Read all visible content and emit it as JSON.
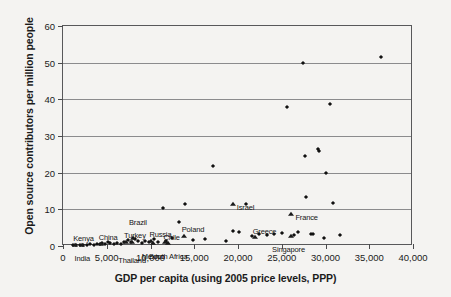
{
  "chart_data": {
    "type": "scatter",
    "title": "",
    "xlabel": "GDP per capita (using 2005 price levels, PPP)",
    "ylabel": "Open source contributors per million people",
    "xlim": [
      0,
      40000
    ],
    "ylim": [
      0,
      60
    ],
    "grid": true,
    "legend": "none",
    "xticks": [
      0,
      5000,
      10000,
      15000,
      20000,
      25000,
      30000,
      35000,
      40000
    ],
    "xtick_labels": [
      "0",
      "5,000",
      "10,000",
      "15,000",
      "20,000",
      "25,000",
      "30,000",
      "35,000",
      "40,000"
    ],
    "yticks": [
      0,
      10,
      20,
      30,
      40,
      50,
      60
    ],
    "ytick_labels": [
      "0",
      "10",
      "20",
      "30",
      "40",
      "50",
      "60"
    ],
    "series": [
      {
        "name": "unlabeled countries",
        "marker": "diamond",
        "points": [
          {
            "x": 1100,
            "y": 0.2
          },
          {
            "x": 1500,
            "y": 0.3
          },
          {
            "x": 1900,
            "y": 0.2
          },
          {
            "x": 2300,
            "y": 0.4
          },
          {
            "x": 2700,
            "y": 0.3
          },
          {
            "x": 3100,
            "y": 0.5
          },
          {
            "x": 3500,
            "y": 0.4
          },
          {
            "x": 3900,
            "y": 0.6
          },
          {
            "x": 4200,
            "y": 0.5
          },
          {
            "x": 4500,
            "y": 0.8
          },
          {
            "x": 4800,
            "y": 0.6
          },
          {
            "x": 5100,
            "y": 1.0
          },
          {
            "x": 5400,
            "y": 0.7
          },
          {
            "x": 5800,
            "y": 0.5
          },
          {
            "x": 6200,
            "y": 0.9
          },
          {
            "x": 6600,
            "y": 0.6
          },
          {
            "x": 7000,
            "y": 1.2
          },
          {
            "x": 7400,
            "y": 1.6
          },
          {
            "x": 7800,
            "y": 1.1
          },
          {
            "x": 8200,
            "y": 2.0
          },
          {
            "x": 8600,
            "y": 1.3
          },
          {
            "x": 9000,
            "y": 0.9
          },
          {
            "x": 9400,
            "y": 1.5
          },
          {
            "x": 9800,
            "y": 1.2
          },
          {
            "x": 10400,
            "y": 1.8
          },
          {
            "x": 10900,
            "y": 1.1
          },
          {
            "x": 11400,
            "y": 10.3
          },
          {
            "x": 11800,
            "y": 1.4
          },
          {
            "x": 12400,
            "y": 2.2
          },
          {
            "x": 13200,
            "y": 6.6
          },
          {
            "x": 13900,
            "y": 11.5
          },
          {
            "x": 14800,
            "y": 1.6
          },
          {
            "x": 16200,
            "y": 2.0
          },
          {
            "x": 17100,
            "y": 21.9
          },
          {
            "x": 18600,
            "y": 1.3
          },
          {
            "x": 19400,
            "y": 4.2
          },
          {
            "x": 20100,
            "y": 3.9
          },
          {
            "x": 20900,
            "y": 11.4
          },
          {
            "x": 21600,
            "y": 2.6
          },
          {
            "x": 22400,
            "y": 3.4
          },
          {
            "x": 23300,
            "y": 2.9
          },
          {
            "x": 24100,
            "y": 3.3
          },
          {
            "x": 25000,
            "y": 3.6
          },
          {
            "x": 25600,
            "y": 37.8
          },
          {
            "x": 26400,
            "y": 3.1
          },
          {
            "x": 26900,
            "y": 3.9
          },
          {
            "x": 27400,
            "y": 50.0
          },
          {
            "x": 27600,
            "y": 24.6
          },
          {
            "x": 27800,
            "y": 13.4
          },
          {
            "x": 28300,
            "y": 3.4
          },
          {
            "x": 28600,
            "y": 3.3
          },
          {
            "x": 29100,
            "y": 26.4
          },
          {
            "x": 29300,
            "y": 25.8
          },
          {
            "x": 29800,
            "y": 2.3
          },
          {
            "x": 30100,
            "y": 19.8
          },
          {
            "x": 30500,
            "y": 38.8
          },
          {
            "x": 30900,
            "y": 11.7
          },
          {
            "x": 31600,
            "y": 3.0
          },
          {
            "x": 36300,
            "y": 51.6
          }
        ]
      },
      {
        "name": "labeled countries",
        "marker": "triangle",
        "points": [
          {
            "x": 1400,
            "y": 0.2,
            "label": "Kenya",
            "lx": -2,
            "ly": -11,
            "anchor": "start"
          },
          {
            "x": 2200,
            "y": 0.3,
            "label": "India",
            "lx": 0,
            "ly": 9,
            "anchor": "middle"
          },
          {
            "x": 4300,
            "y": 0.6,
            "label": "China",
            "lx": -2,
            "ly": -11,
            "anchor": "start"
          },
          {
            "x": 7200,
            "y": 1.2,
            "label": "Turkey",
            "lx": -2,
            "ly": -11,
            "anchor": "start"
          },
          {
            "x": 7900,
            "y": 1.0,
            "label": "Thailand",
            "lx": 0,
            "ly": 14,
            "anchor": "middle"
          },
          {
            "x": 8000,
            "y": 2.3,
            "label": "Brazil",
            "lx": -4,
            "ly": -20,
            "anchor": "start"
          },
          {
            "x": 10100,
            "y": 1.5,
            "label": "Russia",
            "lx": -2,
            "ly": -11,
            "anchor": "start"
          },
          {
            "x": 10300,
            "y": 0.8,
            "label": "Mexico",
            "lx": 0,
            "ly": 9,
            "anchor": "middle"
          },
          {
            "x": 11700,
            "y": 1.2,
            "label": "Chile",
            "lx": -2,
            "ly": -9,
            "anchor": "start"
          },
          {
            "x": 12000,
            "y": 0.7,
            "label": "South Africa",
            "lx": 0,
            "ly": 9,
            "anchor": "middle"
          },
          {
            "x": 13800,
            "y": 2.6,
            "label": "Poland",
            "lx": -2,
            "ly": -11,
            "anchor": "start"
          },
          {
            "x": 19400,
            "y": 11.4,
            "label": "Israel",
            "lx": 4,
            "ly": -1,
            "anchor": "start"
          },
          {
            "x": 21900,
            "y": 2.4,
            "label": "Greece",
            "lx": -2,
            "ly": -10,
            "anchor": "start"
          },
          {
            "x": 26100,
            "y": 8.6,
            "label": "France",
            "lx": 4,
            "ly": -1,
            "anchor": "start"
          },
          {
            "x": 26000,
            "y": 2.6,
            "label": "Singapore",
            "lx": -2,
            "ly": 9,
            "anchor": "middle"
          }
        ]
      }
    ]
  }
}
